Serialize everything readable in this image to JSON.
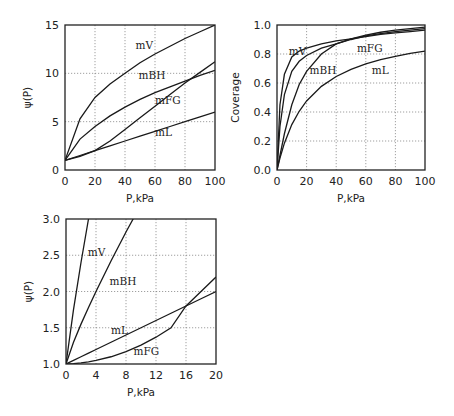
{
  "chart_data": [
    {
      "id": "psi_full",
      "type": "line",
      "title": "",
      "xlabel": "P,kPa",
      "ylabel": "ψ(P)",
      "xlim": [
        0,
        100
      ],
      "ylim": [
        0,
        15
      ],
      "xticks": [
        0,
        20,
        40,
        60,
        80,
        100
      ],
      "yticks": [
        0,
        5,
        10,
        15
      ],
      "grid": true,
      "legend": "inline curve labels",
      "box": {
        "x0": 65,
        "y0": 25,
        "x1": 215,
        "y1": 170
      },
      "x": [
        0,
        10,
        20,
        30,
        40,
        50,
        60,
        70,
        80,
        90,
        100
      ],
      "series": [
        {
          "name": "mV",
          "values": [
            1.0,
            5.3,
            7.5,
            8.9,
            10.0,
            11.1,
            12.0,
            12.8,
            13.6,
            14.3,
            15.0
          ],
          "label_pos": [
            47,
            12.9
          ]
        },
        {
          "name": "mBH",
          "values": [
            1.0,
            3.2,
            4.5,
            5.6,
            6.5,
            7.3,
            8.0,
            8.6,
            9.2,
            9.8,
            10.3
          ],
          "label_pos": [
            49,
            9.8
          ]
        },
        {
          "name": "mFG",
          "values": [
            1.0,
            1.4,
            2.0,
            3.0,
            4.2,
            5.4,
            6.6,
            7.8,
            9.0,
            10.1,
            11.2
          ],
          "label_pos": [
            60,
            7.2
          ]
        },
        {
          "name": "mL",
          "values": [
            1.0,
            1.5,
            2.0,
            2.5,
            3.0,
            3.5,
            4.0,
            4.5,
            5.0,
            5.5,
            6.0
          ],
          "label_pos": [
            60,
            3.9
          ]
        }
      ]
    },
    {
      "id": "coverage",
      "type": "line",
      "title": "",
      "xlabel": "P,kPa",
      "ylabel": "Coverage",
      "xlim": [
        0,
        100
      ],
      "ylim": [
        0.0,
        1.0
      ],
      "xticks": [
        0,
        20,
        40,
        60,
        80,
        100
      ],
      "yticks": [
        0.0,
        0.2,
        0.4,
        0.6,
        0.8,
        1.0
      ],
      "grid": true,
      "legend": "inline curve labels",
      "box": {
        "x0": 277,
        "y0": 25,
        "x1": 425,
        "y1": 170
      },
      "x": [
        0,
        2,
        5,
        10,
        15,
        20,
        30,
        40,
        50,
        60,
        70,
        80,
        90,
        100
      ],
      "series": [
        {
          "name": "mV",
          "values": [
            0.0,
            0.45,
            0.66,
            0.78,
            0.82,
            0.84,
            0.87,
            0.89,
            0.905,
            0.92,
            0.935,
            0.945,
            0.955,
            0.965
          ],
          "label_pos": [
            8,
            0.82
          ]
        },
        {
          "name": "mBH",
          "values": [
            0.0,
            0.3,
            0.52,
            0.68,
            0.75,
            0.79,
            0.84,
            0.87,
            0.9,
            0.925,
            0.94,
            0.955,
            0.965,
            0.975
          ],
          "label_pos": [
            22,
            0.69
          ]
        },
        {
          "name": "mFG",
          "values": [
            0.0,
            0.1,
            0.25,
            0.45,
            0.59,
            0.68,
            0.8,
            0.87,
            0.905,
            0.93,
            0.95,
            0.965,
            0.975,
            0.985
          ],
          "label_pos": [
            54,
            0.84
          ]
        },
        {
          "name": "mL",
          "values": [
            0.0,
            0.083,
            0.185,
            0.313,
            0.405,
            0.476,
            0.577,
            0.645,
            0.694,
            0.732,
            0.761,
            0.784,
            0.804,
            0.82
          ],
          "label_pos": [
            64,
            0.69
          ]
        }
      ]
    },
    {
      "id": "psi_low",
      "type": "line",
      "title": "",
      "xlabel": "P,kPa",
      "ylabel": "ψ(P)",
      "xlim": [
        0,
        20
      ],
      "ylim": [
        1.0,
        3.0
      ],
      "xticks": [
        0,
        4,
        8,
        12,
        16,
        20
      ],
      "yticks": [
        1.0,
        1.5,
        2.0,
        2.5,
        3.0
      ],
      "grid": true,
      "legend": "inline curve labels",
      "box": {
        "x0": 66,
        "y0": 219,
        "x1": 216,
        "y1": 364
      },
      "x": [
        0,
        1,
        2,
        3,
        4,
        6,
        8,
        10,
        12,
        14,
        16,
        18,
        20
      ],
      "series": [
        {
          "name": "mV",
          "values": [
            1.0,
            1.75,
            2.4,
            3.0,
            null,
            null,
            null,
            null,
            null,
            null,
            null,
            null,
            null
          ],
          "label_pos": [
            2.9,
            2.55
          ]
        },
        {
          "name": "mBH",
          "values": [
            1.0,
            1.3,
            1.55,
            1.78,
            2.0,
            2.42,
            2.82,
            3.2,
            null,
            null,
            null,
            null,
            null
          ],
          "label_pos": [
            5.8,
            2.14
          ]
        },
        {
          "name": "mL",
          "values": [
            1.0,
            1.05,
            1.1,
            1.15,
            1.2,
            1.3,
            1.4,
            1.5,
            1.6,
            1.7,
            1.8,
            1.9,
            2.0
          ],
          "label_pos": [
            6.0,
            1.47
          ]
        },
        {
          "name": "mFG",
          "values": [
            1.0,
            1.005,
            1.015,
            1.03,
            1.05,
            1.1,
            1.17,
            1.26,
            1.37,
            1.5,
            1.8,
            2.0,
            2.2
          ],
          "label_pos": [
            9.0,
            1.18
          ]
        }
      ]
    }
  ]
}
